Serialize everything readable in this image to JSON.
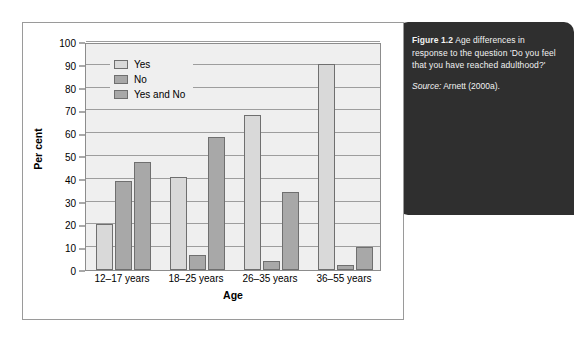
{
  "caption": {
    "figure_label": "Figure 1.2",
    "text": "Age differences in response to the question 'Do you feel that you have reached adulthood?'",
    "source_label": "Source:",
    "source_text": "Arnett (2000a)."
  },
  "colors": {
    "panel_background": "#2f2f2f",
    "panel_text": "#f2f2f2",
    "plot_background": "#efefef",
    "gridline": "#9d9d9d",
    "bar_yes": "#d9d9d9",
    "bar_no": "#a8a8a8",
    "bar_yes_and_no": "#a8a8a8",
    "bar_border": "#6f6f6f",
    "card_border": "#9a9a9a"
  },
  "chart_data": {
    "type": "bar",
    "title": "",
    "xlabel": "Age",
    "ylabel": "Per cent",
    "ylim": [
      0,
      100
    ],
    "ytick_step": 10,
    "yticks": [
      0,
      10,
      20,
      30,
      40,
      50,
      60,
      70,
      80,
      90,
      100
    ],
    "grid": true,
    "legend_position": "top-left inside plot",
    "categories": [
      "12–17 years",
      "18–25 years",
      "26–35 years",
      "36–55 years"
    ],
    "series": [
      {
        "name": "Yes",
        "color": "#d9d9d9",
        "values": [
          20,
          41,
          68,
          90.5
        ]
      },
      {
        "name": "No",
        "color": "#a8a8a8",
        "values": [
          39,
          6.5,
          4,
          2
        ]
      },
      {
        "name": "Yes and No",
        "color": "#a8a8a8",
        "values": [
          47.5,
          58.5,
          34,
          10
        ]
      }
    ]
  }
}
